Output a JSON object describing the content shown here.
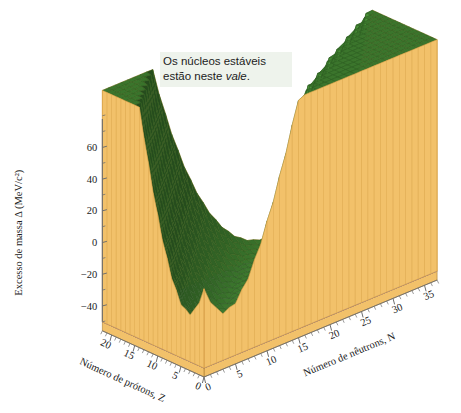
{
  "figure": {
    "background_color": "#ffffff",
    "caption_note": ""
  },
  "annotation": {
    "name": "stability-valley-callout",
    "line1": "Os núcleos estáveis",
    "line2_prefix": "estão neste ",
    "line2_italic": "vale",
    "line2_suffix": ".",
    "background_color": "#eef3ec",
    "text_color": "#1c1c1c"
  },
  "colors": {
    "surface_mesh": "#3d7a2e",
    "surface_mesh_light": "#4e8e3a",
    "surface_mesh_dark": "#2d5c22",
    "curtain_wall": "#f2c16a",
    "curtain_wall_dark": "#d9a349",
    "base_plane": "#c8aec4",
    "base_grid": "#8c6f8b",
    "base_edge": "#f2c16a",
    "axis_line": "#6e6e6e",
    "text": "#1b1b1b"
  },
  "axes": {
    "z": {
      "name": "mass-excess-axis",
      "label": "Excesso de massa Δ (MeV/c²)",
      "label_parts": {
        "prefix": "Excesso de massa ",
        "symbol": "Δ",
        "units": " (MeV/c²)"
      },
      "ticks": [
        60,
        40,
        20,
        0,
        -20,
        -40
      ],
      "tick_labels": [
        "60",
        "40",
        "20",
        "0",
        "−20",
        "−40"
      ],
      "minor_ticks_between": 1,
      "range": [
        -50,
        70
      ]
    },
    "x": {
      "name": "neutron-number-axis",
      "label": "Número de nêutrons, N",
      "ticks": [
        0,
        5,
        10,
        15,
        20,
        25,
        30,
        35
      ],
      "tick_labels": [
        "0",
        "5",
        "10",
        "15",
        "20",
        "25",
        "30",
        "35"
      ],
      "range": [
        0,
        37
      ]
    },
    "y": {
      "name": "proton-number-axis",
      "label": "Número de prótons, Z",
      "ticks": [
        0,
        5,
        10,
        15,
        20
      ],
      "tick_labels": [
        "0",
        "5",
        "10",
        "15",
        "20"
      ],
      "range": [
        0,
        22
      ]
    }
  },
  "chart_data": {
    "type": "surface",
    "title": "",
    "subtitle": "",
    "xlabel": "Número de nêutrons, N",
    "ylabel": "Número de prótons, Z",
    "zlabel": "Excesso de massa Δ (MeV/c²)",
    "xlim": [
      0,
      37
    ],
    "ylim": [
      0,
      22
    ],
    "zlim": [
      -50,
      70
    ],
    "grid": true,
    "legend": "none",
    "annotations": [
      {
        "text": "Os núcleos estáveis estão neste vale.",
        "x": 12,
        "y": 4,
        "z": 62
      }
    ],
    "x_grid": [
      0,
      2,
      4,
      6,
      8,
      10,
      12,
      14,
      16,
      18,
      20,
      22,
      24,
      26,
      28,
      30,
      32,
      34,
      36
    ],
    "y_grid": [
      0,
      2,
      4,
      6,
      8,
      10,
      12,
      14,
      16,
      18,
      20,
      22
    ],
    "surface_model": {
      "formula": "mass_excess(N,Z) approximated by semi-empirical valley; minimum along Z ~= N for light nuclei",
      "valley_center_slope": 1.0,
      "valley_curvature": 1.35,
      "baseline_min": -48,
      "rise_per_unit_A": 0.9,
      "max_plotted": 70
    },
    "sample_points": [
      {
        "N": 0,
        "Z": 1,
        "delta": 7.3
      },
      {
        "N": 1,
        "Z": 1,
        "delta": 13.1
      },
      {
        "N": 2,
        "Z": 2,
        "delta": 2.4
      },
      {
        "N": 4,
        "Z": 3,
        "delta": 14.9
      },
      {
        "N": 6,
        "Z": 6,
        "delta": 0.0
      },
      {
        "N": 8,
        "Z": 8,
        "delta": -4.7
      },
      {
        "N": 10,
        "Z": 10,
        "delta": -7.0
      },
      {
        "N": 12,
        "Z": 12,
        "delta": -13.9
      },
      {
        "N": 14,
        "Z": 14,
        "delta": -21.5
      },
      {
        "N": 16,
        "Z": 16,
        "delta": -26.0
      },
      {
        "N": 20,
        "Z": 20,
        "delta": -35.1
      },
      {
        "N": 22,
        "Z": 20,
        "delta": -44.2
      },
      {
        "N": 24,
        "Z": 20,
        "delta": -43.1
      },
      {
        "N": 28,
        "Z": 22,
        "delta": -46.0
      },
      {
        "N": 30,
        "Z": 20,
        "delta": -34.0
      },
      {
        "N": 34,
        "Z": 20,
        "delta": -18.0
      },
      {
        "N": 0,
        "Z": 20,
        "delta": 68.0
      },
      {
        "N": 36,
        "Z": 2,
        "delta": 70.0
      }
    ]
  }
}
